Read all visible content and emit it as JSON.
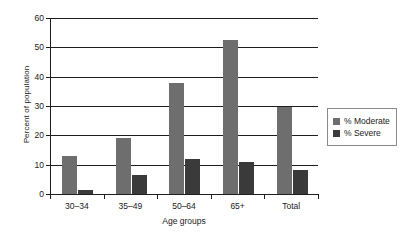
{
  "chart_data": {
    "type": "bar",
    "title": "",
    "xlabel": "Age groups",
    "ylabel": "Percent of population",
    "categories": [
      "30–34",
      "35–49",
      "50–64",
      "65+",
      "Total"
    ],
    "series": [
      {
        "name": "% Moderate",
        "color": "#6e6e6e",
        "values": [
          12.8,
          19.1,
          38.0,
          52.5,
          29.5
        ]
      },
      {
        "name": "% Severe",
        "color": "#3a3a3a",
        "values": [
          1.5,
          6.5,
          11.8,
          10.8,
          8.3
        ]
      }
    ],
    "ylim": [
      0,
      60
    ],
    "yticks": [
      0,
      10,
      20,
      30,
      40,
      50,
      60
    ],
    "grid": true,
    "legend_position": "right"
  },
  "legend": {
    "items": [
      {
        "label": "% Moderate"
      },
      {
        "label": "% Severe"
      }
    ]
  }
}
